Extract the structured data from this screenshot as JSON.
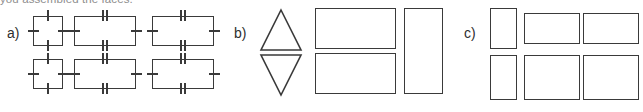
{
  "caption": {
    "text": "you assembled the faces."
  },
  "figure": {
    "background_color": "#ffffff",
    "stroke_color": "#3a3a3a",
    "parts": [
      {
        "label": "a)",
        "description": "net of a rectangular prism: two rows of three quadrilaterals, one square and two congruent rectangles per row, marked with congruence ticks",
        "shapes": [
          {
            "kind": "square",
            "ticks_top": 1,
            "ticks_bottom": 1,
            "ticks_left": 1,
            "ticks_right": 1
          },
          {
            "kind": "rectangle",
            "ticks_top": 2,
            "ticks_bottom": 2,
            "ticks_left": 1,
            "ticks_right": 1
          },
          {
            "kind": "rectangle",
            "ticks_top": 2,
            "ticks_bottom": 2,
            "ticks_left": 1,
            "ticks_right": 1
          },
          {
            "kind": "square",
            "ticks_top": 1,
            "ticks_bottom": 1,
            "ticks_left": 1,
            "ticks_right": 1
          },
          {
            "kind": "rectangle",
            "ticks_top": 2,
            "ticks_bottom": 2,
            "ticks_left": 1,
            "ticks_right": 1
          },
          {
            "kind": "rectangle",
            "ticks_top": 2,
            "ticks_bottom": 2,
            "ticks_left": 1,
            "ticks_right": 1
          }
        ]
      },
      {
        "label": "b)",
        "description": "net pieces: an upward triangle above a downward triangle, two stacked wide rectangles, and one tall rectangle",
        "shapes": [
          {
            "kind": "triangle-up"
          },
          {
            "kind": "triangle-down"
          },
          {
            "kind": "rectangle-wide"
          },
          {
            "kind": "rectangle-wide"
          },
          {
            "kind": "rectangle-tall"
          }
        ]
      },
      {
        "label": "c)",
        "description": "net pieces: two rows, each with one narrow tall rectangle and two wide rectangles",
        "shapes": [
          {
            "kind": "rectangle-narrow"
          },
          {
            "kind": "rectangle-wide"
          },
          {
            "kind": "rectangle-wide"
          },
          {
            "kind": "rectangle-narrow"
          },
          {
            "kind": "rectangle-wide"
          },
          {
            "kind": "rectangle-wide"
          }
        ]
      }
    ]
  }
}
